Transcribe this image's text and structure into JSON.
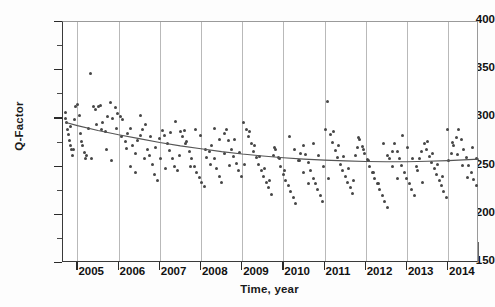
{
  "chart_data": {
    "type": "scatter",
    "title": "",
    "xlabel": "Time, year",
    "ylabel": "Q-Factor",
    "xlim": [
      2004.65,
      2014.75
    ],
    "ylim": [
      150,
      400
    ],
    "grid": "vertical-only",
    "legend": "none",
    "y_ticks": [
      400,
      350,
      300,
      250,
      200,
      150
    ],
    "y_minor_step": 25,
    "x_ticks": [
      2005,
      2006,
      2007,
      2008,
      2009,
      2010,
      2011,
      2012,
      2013,
      2014
    ],
    "x_minor_step": 0.0833,
    "marker": {
      "shape": "circle",
      "size": 3,
      "color": "#464646"
    },
    "trend": {
      "name": "fitted trend",
      "color": "#555555",
      "type": "line",
      "x": [
        2004.7,
        2005.0,
        2005.5,
        2006.0,
        2006.5,
        2007.0,
        2007.5,
        2008.0,
        2008.5,
        2009.0,
        2009.5,
        2010.0,
        2010.5,
        2011.0,
        2011.5,
        2012.0,
        2012.5,
        2013.0,
        2013.5,
        2014.0,
        2014.75
      ],
      "y": [
        296.0,
        292.5,
        287.5,
        283.0,
        279.0,
        275.0,
        271.5,
        268.5,
        265.5,
        263.0,
        261.0,
        259.2,
        257.8,
        256.7,
        255.9,
        255.3,
        255.0,
        255.1,
        255.5,
        256.2,
        257.8
      ]
    },
    "series": [
      {
        "name": "Q-Factor measurements",
        "x": [
          2004.7,
          2004.72,
          2004.74,
          2004.76,
          2004.78,
          2004.8,
          2004.82,
          2004.84,
          2004.86,
          2004.88,
          2004.92,
          2004.96,
          2005.0,
          2005.04,
          2005.08,
          2005.12,
          2005.16,
          2005.2,
          2005.26,
          2005.32,
          2005.38,
          2005.44,
          2005.5,
          2005.56,
          2005.62,
          2005.68,
          2005.74,
          2005.8,
          2005.86,
          2005.92,
          2005.98,
          2006.04,
          2006.1,
          2006.16,
          2006.22,
          2006.28,
          2006.34,
          2006.4,
          2006.46,
          2006.52,
          2006.58,
          2006.64,
          2006.7,
          2006.76,
          2006.82,
          2006.88,
          2006.94,
          2007.0,
          2007.06,
          2007.12,
          2007.18,
          2007.24,
          2007.3,
          2007.36,
          2007.42,
          2007.48,
          2007.54,
          2007.6,
          2007.66,
          2007.72,
          2007.78,
          2007.84,
          2007.9,
          2007.96,
          2008.02,
          2008.08,
          2008.14,
          2008.2,
          2008.26,
          2008.32,
          2008.38,
          2008.44,
          2008.5,
          2008.56,
          2008.62,
          2008.68,
          2008.74,
          2008.8,
          2008.86,
          2008.92,
          2008.98,
          2009.04,
          2009.1,
          2009.16,
          2009.22,
          2009.28,
          2009.34,
          2009.4,
          2009.46,
          2009.52,
          2009.58,
          2009.64,
          2009.7,
          2009.76,
          2009.82,
          2009.88,
          2009.94,
          2010.0,
          2010.06,
          2010.12,
          2010.18,
          2010.24,
          2010.3,
          2010.36,
          2010.42,
          2010.48,
          2010.54,
          2010.6,
          2010.66,
          2010.72,
          2010.78,
          2010.84,
          2010.9,
          2010.96,
          2011.02,
          2011.08,
          2011.14,
          2011.2,
          2011.26,
          2011.32,
          2011.38,
          2011.44,
          2011.5,
          2011.56,
          2011.62,
          2011.68,
          2011.74,
          2011.8,
          2011.86,
          2011.92,
          2011.98,
          2012.04,
          2012.1,
          2012.16,
          2012.22,
          2012.28,
          2012.34,
          2012.4,
          2012.46,
          2012.52,
          2012.58,
          2012.64,
          2012.7,
          2012.76,
          2012.82,
          2012.88,
          2012.94,
          2013.0,
          2013.06,
          2013.12,
          2013.18,
          2013.24,
          2013.3,
          2013.36,
          2013.42,
          2013.48,
          2013.54,
          2013.6,
          2013.66,
          2013.72,
          2013.78,
          2013.84,
          2013.9,
          2013.96,
          2014.02,
          2014.08,
          2014.14,
          2014.2,
          2014.26,
          2014.32,
          2014.38,
          2014.44,
          2014.5,
          2014.56,
          2014.62,
          2014.68,
          2004.9,
          2005.1,
          2005.22,
          2005.34,
          2005.46,
          2005.58,
          2005.7,
          2005.82,
          2005.94,
          2006.06,
          2006.18,
          2006.3,
          2006.42,
          2006.54,
          2006.66,
          2006.78,
          2006.9,
          2007.02,
          2007.14,
          2007.26,
          2007.38,
          2007.5,
          2007.62,
          2007.74,
          2007.86,
          2007.98,
          2008.1,
          2008.22,
          2008.34,
          2008.46,
          2008.58,
          2008.7,
          2008.82,
          2008.94,
          2009.06,
          2009.18,
          2009.3,
          2009.42,
          2009.54,
          2009.66,
          2009.78,
          2009.9,
          2010.02,
          2010.14,
          2010.26,
          2010.38,
          2010.5,
          2010.62,
          2010.74,
          2010.86,
          2010.98,
          2011.1,
          2011.22,
          2011.34,
          2011.46,
          2011.58,
          2011.7,
          2011.82,
          2011.94,
          2012.06,
          2012.18,
          2012.3,
          2012.42,
          2012.54,
          2012.66,
          2012.78,
          2012.9,
          2013.02,
          2013.14,
          2013.26,
          2013.38,
          2013.5,
          2013.62,
          2013.74,
          2013.86,
          2013.98,
          2014.1,
          2014.22,
          2014.34,
          2014.46,
          2014.58,
          2014.7
        ],
        "y": [
          300,
          306,
          296,
          289,
          283,
          277,
          292,
          272,
          268,
          262,
          299,
          312,
          314,
          303,
          284,
          272,
          265,
          258,
          290,
          347,
          312,
          309,
          312,
          313,
          296,
          286,
          302,
          316,
          300,
          311,
          305,
          302,
          299,
          276,
          284,
          290,
          272,
          264,
          277,
          282,
          288,
          258,
          268,
          262,
          252,
          242,
          236,
          279,
          287,
          282,
          274,
          267,
          258,
          250,
          246,
          262,
          281,
          287,
          276,
          266,
          258,
          250,
          244,
          239,
          233,
          229,
          259,
          266,
          272,
          258,
          248,
          240,
          234,
          284,
          288,
          277,
          268,
          260,
          253,
          246,
          240,
          296,
          289,
          281,
          274,
          266,
          259,
          252,
          246,
          240,
          234,
          228,
          221,
          262,
          268,
          259,
          250,
          242,
          236,
          230,
          224,
          218,
          212,
          256,
          264,
          272,
          263,
          254,
          246,
          238,
          232,
          226,
          220,
          214,
          289,
          318,
          283,
          275,
          267,
          259,
          252,
          246,
          240,
          234,
          228,
          222,
          262,
          270,
          278,
          271,
          264,
          257,
          250,
          244,
          238,
          232,
          226,
          220,
          214,
          208,
          258,
          266,
          274,
          266,
          258,
          251,
          244,
          238,
          232,
          226,
          220,
          250,
          258,
          266,
          274,
          268,
          261,
          254,
          248,
          242,
          236,
          230,
          224,
          218,
          256,
          264,
          272,
          280,
          288,
          278,
          268,
          259,
          251,
          244,
          237,
          230,
          268,
          276,
          262,
          258,
          294,
          288,
          268,
          256,
          290,
          281,
          269,
          250,
          244,
          303,
          294,
          281,
          270,
          258,
          248,
          285,
          297,
          286,
          274,
          250,
          288,
          282,
          268,
          252,
          290,
          278,
          264,
          251,
          278,
          265,
          252,
          286,
          272,
          260,
          248,
          236,
          270,
          258,
          246,
          281,
          268,
          256,
          244,
          232,
          274,
          262,
          250,
          238,
          286,
          272,
          260,
          248,
          236,
          280,
          268,
          256,
          244,
          232,
          274,
          262,
          250,
          238,
          282,
          270,
          258,
          246,
          234,
          276,
          264,
          252,
          240,
          288,
          275,
          263,
          251,
          239,
          270,
          258
        ]
      }
    ]
  }
}
